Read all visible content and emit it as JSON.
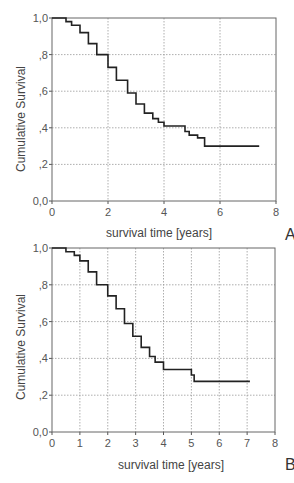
{
  "chart_data": [
    {
      "type": "line",
      "panel": "A",
      "title": "",
      "xlabel": "survival time [years]",
      "ylabel": "Cumulative Survival",
      "xlim": [
        0,
        8
      ],
      "ylim": [
        0,
        1
      ],
      "x_ticks": [
        "0",
        "2",
        "4",
        "6",
        "8"
      ],
      "y_ticks": [
        "0,0",
        ",2",
        ",4",
        ",6",
        ",8",
        "1,0"
      ],
      "grid": true,
      "step": true,
      "series": [
        {
          "name": "Kaplan-Meier",
          "x": [
            0,
            0.25,
            0.5,
            0.7,
            1.0,
            1.3,
            1.6,
            2.0,
            2.3,
            2.7,
            3.0,
            3.3,
            3.6,
            3.8,
            4.0,
            4.65,
            4.75,
            4.9,
            5.2,
            5.45,
            7.4
          ],
          "y": [
            1.0,
            1.0,
            0.98,
            0.96,
            0.92,
            0.86,
            0.8,
            0.73,
            0.66,
            0.59,
            0.53,
            0.48,
            0.45,
            0.43,
            0.41,
            0.41,
            0.38,
            0.36,
            0.345,
            0.3,
            0.3
          ]
        }
      ]
    },
    {
      "type": "line",
      "panel": "B",
      "title": "",
      "xlabel": "survival time [years]",
      "ylabel": "Cumulative Survival",
      "xlim": [
        0,
        8
      ],
      "ylim": [
        0,
        1
      ],
      "x_ticks": [
        "0",
        "1",
        "2",
        "3",
        "4",
        "5",
        "6",
        "7",
        "8"
      ],
      "y_ticks": [
        "0,0",
        ",2",
        ",4",
        ",6",
        ",8",
        "1,0"
      ],
      "grid": true,
      "step": true,
      "series": [
        {
          "name": "Kaplan-Meier",
          "x": [
            0,
            0.15,
            0.5,
            0.8,
            1.0,
            1.3,
            1.6,
            2.0,
            2.3,
            2.6,
            2.9,
            3.2,
            3.5,
            3.7,
            4.0,
            4.8,
            5.0,
            5.1,
            7.1
          ],
          "y": [
            1.0,
            1.0,
            0.98,
            0.96,
            0.93,
            0.87,
            0.8,
            0.74,
            0.67,
            0.59,
            0.52,
            0.46,
            0.41,
            0.38,
            0.34,
            0.34,
            0.31,
            0.275,
            0.275
          ]
        }
      ]
    }
  ],
  "panels": {
    "A": {
      "letter": "A",
      "ylabel": "Cumulative Survival",
      "xlabel": "survival time [years]"
    },
    "B": {
      "letter": "B",
      "ylabel": "Cumulative Survival",
      "xlabel": "survival time [years]"
    }
  }
}
